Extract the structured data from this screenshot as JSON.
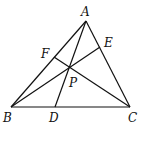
{
  "diagram": {
    "type": "triangle-cevians",
    "points": {
      "A": {
        "x": 86,
        "y": 21
      },
      "B": {
        "x": 11,
        "y": 107
      },
      "C": {
        "x": 130,
        "y": 107
      },
      "D": {
        "x": 55,
        "y": 107
      },
      "E": {
        "x": 100,
        "y": 47
      },
      "F": {
        "x": 54,
        "y": 57
      },
      "P": {
        "x": 69,
        "y": 68
      }
    },
    "labels": {
      "A": "A",
      "B": "B",
      "C": "C",
      "D": "D",
      "E": "E",
      "F": "F",
      "P": "P"
    },
    "segments": [
      [
        "A",
        "B"
      ],
      [
        "B",
        "C"
      ],
      [
        "C",
        "A"
      ],
      [
        "A",
        "D"
      ],
      [
        "B",
        "E"
      ],
      [
        "C",
        "F"
      ]
    ],
    "stroke_color": "#111111",
    "background": "#ffffff"
  }
}
